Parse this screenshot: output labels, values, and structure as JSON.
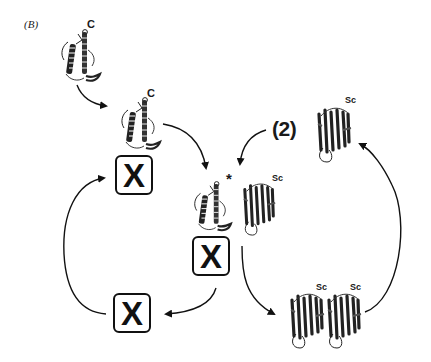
{
  "figure": {
    "panel_label": "(B)"
  },
  "nodes": {
    "native_protein": {
      "label": "C",
      "type": "alpha-helical protein"
    },
    "intermediate_protein": {
      "label": "C",
      "type": "alpha-helical protein"
    },
    "activated_protein": {
      "label": "*",
      "type": "alpha-helical protein (activated)"
    },
    "center_sc": {
      "label": "Sc",
      "type": "beta-sheet protein"
    },
    "step2": {
      "label": "(2)"
    },
    "step2_sc": {
      "label": "Sc",
      "type": "beta-sheet protein"
    },
    "dimer_sc_left": {
      "label": "Sc"
    },
    "dimer_sc_right": {
      "label": "Sc"
    }
  },
  "factor_boxes": [
    {
      "id": "x-top",
      "label": "X"
    },
    {
      "id": "x-center",
      "label": "X"
    },
    {
      "id": "x-bottom",
      "label": "X"
    }
  ],
  "colors": {
    "ink": "#111111",
    "background": "#ffffff"
  }
}
